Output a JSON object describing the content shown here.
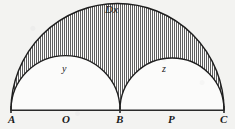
{
  "figure": {
    "title_label": "Dx",
    "arc_label_left": "y",
    "arc_label_right": "z",
    "points": [
      {
        "id": "A",
        "label": "A",
        "x": 11,
        "y": 110
      },
      {
        "id": "O",
        "label": "O",
        "x": 66,
        "y": 110
      },
      {
        "id": "B",
        "label": "B",
        "x": 120,
        "y": 110
      },
      {
        "id": "P",
        "label": "P",
        "x": 172,
        "y": 110
      },
      {
        "id": "C",
        "label": "C",
        "x": 224,
        "y": 110
      }
    ],
    "colors": {
      "ink": "#1a1a1a",
      "background": "#f3f3f1",
      "hatch": "#4a4a4a",
      "inner_fill": "#fbfbfa"
    },
    "geometry": {
      "baseline_y": 110,
      "big_arc": {
        "center_x": 117.5,
        "radius": 106.5,
        "apex_y": 20
      },
      "left_arc": {
        "center_x": 65.5,
        "radius": 54.5,
        "apex_y": 56
      },
      "right_arc": {
        "center_x": 172,
        "radius": 52,
        "apex_y": 58
      },
      "hatch_spacing": 2,
      "hatch_direction": "vertical"
    }
  }
}
